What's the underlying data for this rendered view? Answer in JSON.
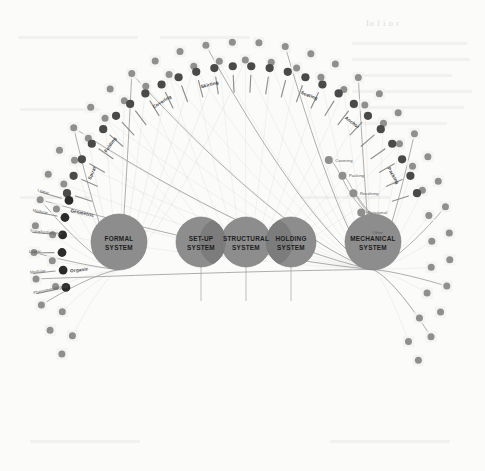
{
  "figure": {
    "type": "radial-network",
    "background_color": "#fbfbfa"
  },
  "colors": {
    "system_circle": "#8d8d8d",
    "system_circle_overlap": "#6f6f6f",
    "system_circle_stroke": "#7b7b7b",
    "node_dark": "#2b2b2b",
    "node_mid": "#4a4a4a",
    "node_gray": "#8f8f8f",
    "edge": "#9a9a9a",
    "leader": "#7d7d7d",
    "label_text": "#565656",
    "system_text": "#1d1d1d"
  },
  "systems": [
    {
      "id": "formal",
      "line1": "FORMAL",
      "line2": "SYSTEM",
      "cx": 119,
      "cy": 242,
      "r": 28
    },
    {
      "id": "setup",
      "line1": "SET-UP",
      "line2": "SYSTEM",
      "cx": 201,
      "cy": 242,
      "r": 25
    },
    {
      "id": "structural",
      "line1": "STRUCTURAL",
      "line2": "SYSTEM",
      "cx": 246,
      "cy": 242,
      "r": 25
    },
    {
      "id": "holding",
      "line1": "HOLDING",
      "line2": "SYSTEM",
      "cx": 291,
      "cy": 242,
      "r": 25
    },
    {
      "id": "mechanical",
      "line1": "MECHANICAL",
      "line2": "SYSTEM",
      "cx": 373,
      "cy": 242,
      "r": 28
    }
  ],
  "formal_system_attributes": {
    "group_labels": [
      "Organic",
      "Geometric"
    ],
    "items": [
      "Phenomenological",
      "Modular",
      "Linear",
      "Transformational",
      "Modular",
      "Linear"
    ]
  },
  "mechanical_system_outputs": {
    "items": [
      "Covering",
      "Packing",
      "Revolving",
      "Rotational",
      "Other"
    ]
  },
  "top_arc": {
    "group_labels": [
      "Folding",
      "Covering",
      "Spiral",
      "Skirting",
      "Seating",
      "Anchor",
      "Packing"
    ],
    "node_count": 26
  },
  "bottom_arc": {
    "description": "two concentric rows of gray nodes spanning the lower half of the circle",
    "outer_node_count": 34,
    "inner_node_count": 31
  },
  "legend": {
    "note": "Curved edges connect the FORMAL, STRUCTURAL and MECHANICAL system hubs to nodes on the surrounding rings."
  }
}
